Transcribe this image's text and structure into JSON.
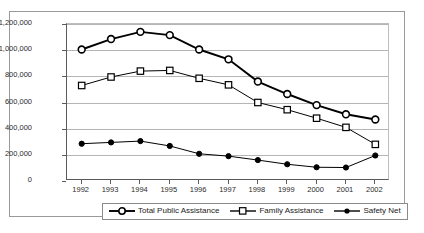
{
  "chart_data": {
    "type": "line",
    "title": "",
    "xlabel": "",
    "ylabel": "",
    "categories": [
      "1992",
      "1993",
      "1994",
      "1995",
      "1996",
      "1997",
      "1998",
      "1999",
      "2000",
      "2001",
      "2002"
    ],
    "ylim": [
      0,
      1200000
    ],
    "ytick_labels": [
      "1,200,000",
      "1,000,000",
      "800,000",
      "600,000",
      "400,000",
      "200,000",
      "0"
    ],
    "ytick_values": [
      1200000,
      1000000,
      800000,
      600000,
      400000,
      200000,
      0
    ],
    "grid": true,
    "legend_position": "bottom",
    "series": [
      {
        "name": "Total Public Assistance",
        "marker": "open-circle",
        "values": [
          1005000,
          1085000,
          1140000,
          1115000,
          1005000,
          930000,
          760000,
          665000,
          580000,
          510000,
          470000
        ]
      },
      {
        "name": "Family Assistance",
        "marker": "open-square",
        "values": [
          730000,
          795000,
          840000,
          845000,
          785000,
          735000,
          600000,
          545000,
          480000,
          410000,
          280000
        ]
      },
      {
        "name": "Safety Net",
        "marker": "filled-circle",
        "values": [
          285000,
          295000,
          305000,
          268000,
          208000,
          190000,
          160000,
          128000,
          105000,
          103000,
          195000
        ]
      }
    ]
  },
  "legend": {
    "items": [
      {
        "label": "Total Public Assistance",
        "marker": "open-circle"
      },
      {
        "label": "Family Assistance",
        "marker": "open-square"
      },
      {
        "label": "Safety Net",
        "marker": "filled-circle"
      }
    ]
  },
  "colors": {
    "series_line": "#000000",
    "marker_fill": "#ffffff",
    "gridline": "#b5b5b5",
    "axis": "#5a5a5a",
    "frame": "#9a9a9a",
    "text": "#2b2b2b"
  }
}
